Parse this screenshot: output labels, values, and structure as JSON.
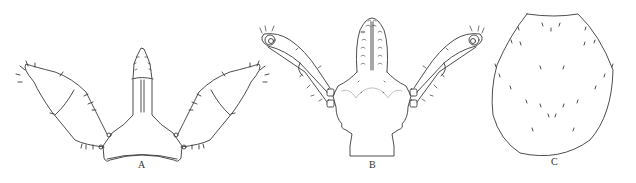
{
  "figure": {
    "panels": [
      {
        "label": "A",
        "description": "Gnathosoma with palps, dorsal view"
      },
      {
        "label": "B",
        "description": "Gnathosoma with palps, ventral view"
      },
      {
        "label": "C",
        "description": "Dorsal shield with setae"
      }
    ],
    "colors": {
      "line": "#3a3a3a",
      "faint": "#b0b0b0",
      "background": "#ffffff"
    }
  }
}
